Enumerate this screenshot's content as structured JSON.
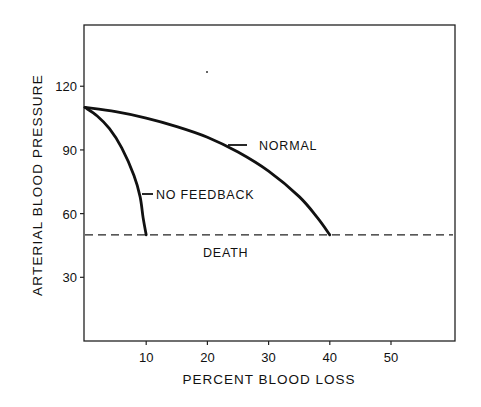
{
  "chart_data": {
    "type": "line",
    "title": "",
    "xlabel": "PERCENT BLOOD LOSS",
    "ylabel": "ARTERIAL BLOOD PRESSURE",
    "xlim": [
      0,
      60
    ],
    "ylim": [
      0,
      150
    ],
    "x_ticks": [
      10,
      20,
      30,
      40,
      50
    ],
    "x_tick_labels": [
      "10",
      "20",
      "30",
      "40",
      "50"
    ],
    "y_ticks": [
      30,
      60,
      90,
      120
    ],
    "y_tick_labels": [
      "30",
      "60",
      "90",
      "120"
    ],
    "grid": false,
    "legend": "inline labels",
    "series": [
      {
        "name": "NORMAL",
        "x": [
          0,
          5,
          10,
          15,
          20,
          25,
          30,
          35,
          38,
          40
        ],
        "y": [
          110,
          108,
          105,
          101,
          96,
          89,
          80,
          68,
          58,
          50
        ]
      },
      {
        "name": "NO FEEDBACK",
        "x": [
          0,
          2,
          4,
          6,
          8,
          9,
          9.5,
          10
        ],
        "y": [
          110,
          106,
          100,
          91,
          78,
          68,
          58,
          50
        ]
      }
    ],
    "reference_lines": [
      {
        "name": "DEATH",
        "orientation": "horizontal",
        "y": 50,
        "style": "dashed"
      }
    ],
    "annotations": [
      {
        "text": "NORMAL",
        "x": 28,
        "y": 94
      },
      {
        "text": "NO FEEDBACK",
        "x": 11.5,
        "y": 69
      },
      {
        "text": "DEATH",
        "x": 19.5,
        "y": 43
      }
    ]
  }
}
